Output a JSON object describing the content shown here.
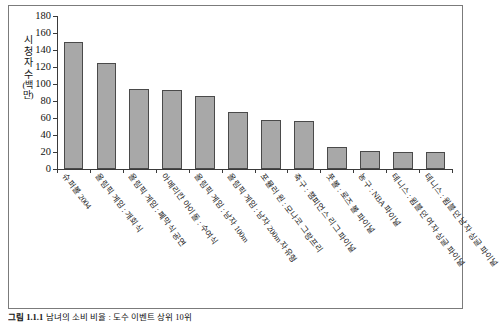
{
  "figure": {
    "caption_number": "그림 1.1.1",
    "caption_text": "남녀의 소비 비율 : 도수 이벤트 상위 10위"
  },
  "chart_data": {
    "type": "bar",
    "title": "",
    "xlabel": "",
    "ylabel": "시청자 수(백만)",
    "ylim": [
      0,
      180
    ],
    "y_ticks": [
      0,
      20,
      40,
      60,
      80,
      100,
      120,
      140,
      160,
      180
    ],
    "grid": false,
    "legend": "none",
    "bar_color": "#a8a8a8",
    "bar_edge_color": "#4a4a4a",
    "categories": [
      "슈퍼볼 2004",
      "올림픽 게임 : 개회식",
      "올림픽 게임 : 폐막식 공연",
      "아메리칸 아이돌 : 수여식",
      "올림픽 게임 : 남자 100m",
      "올림픽 게임 : 남자 200m 자유형",
      "포뮬러 원 : 모나코 그랑프리",
      "축구 : 챔피언스 리그 파이널",
      "풋볼 : 로즈 볼 파이널",
      "농구 : NBA 파이널",
      "테니스 : 윔블던 여자 싱글 파이널",
      "테니스 : 윔블던 남자 싱글 파이널"
    ],
    "values": [
      150,
      125,
      94,
      93,
      86,
      67,
      58,
      56,
      26,
      21,
      20,
      20
    ]
  },
  "axis": {
    "y_label_chars": [
      "시",
      "청",
      "자",
      "수"
    ],
    "y_label_paren": "(백만)"
  }
}
